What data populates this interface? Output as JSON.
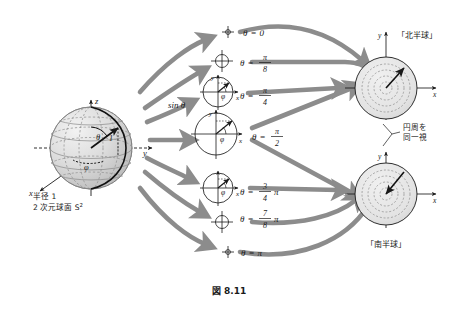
{
  "figure": {
    "caption": "図 8.11",
    "sphere": {
      "label_radius": "半径 1",
      "label_surface": "2 次元球面 S",
      "label_surface_sup": "2",
      "axis_x": "x",
      "axis_y": "y",
      "axis_z": "z",
      "angle_theta": "θ",
      "angle_phi": "φ",
      "radius_value": "1"
    },
    "sin_label": "sin θ",
    "slices": [
      {
        "id": "theta-0",
        "label_theta": "θ",
        "label_eq": "=",
        "label_value": "0",
        "kind": "point",
        "num": "",
        "den": "",
        "pi": ""
      },
      {
        "id": "theta-pi8",
        "label_theta": "θ",
        "label_eq": "=",
        "label_value": "",
        "kind": "circle-small",
        "num": "π",
        "den": "8",
        "pi": ""
      },
      {
        "id": "theta-pi4",
        "label_theta": "θ",
        "label_eq": "=",
        "label_value": "",
        "kind": "circle-mid",
        "num": "π",
        "den": "4",
        "pi": ""
      },
      {
        "id": "theta-pi2",
        "label_theta": "θ",
        "label_eq": "=",
        "label_value": "",
        "kind": "circle-large",
        "num": "π",
        "den": "2",
        "pi": ""
      },
      {
        "id": "theta-3pi4",
        "label_theta": "θ",
        "label_eq": "=",
        "label_value": "",
        "kind": "circle-mid",
        "num": "3",
        "den": "4",
        "pi": "π"
      },
      {
        "id": "theta-7pi8",
        "label_theta": "θ",
        "label_eq": "=",
        "label_value": "",
        "kind": "circle-small",
        "num": "7",
        "den": "8",
        "pi": "π"
      },
      {
        "id": "theta-pi",
        "label_theta": "θ",
        "label_eq": "=",
        "label_value": "π",
        "kind": "point",
        "num": "",
        "den": "",
        "pi": ""
      }
    ],
    "disks": [
      {
        "id": "north",
        "title": "「北半球」",
        "axis_x": "x",
        "axis_y": "y"
      },
      {
        "id": "south",
        "title": "「南半球」",
        "axis_x": "x",
        "axis_y": "y"
      }
    ],
    "annotation": {
      "line1": "円周を",
      "line2": "同一視"
    },
    "colors": {
      "background": "#ffffff",
      "ink": "#1a1a1a",
      "arrow_gray": "#8c8c8c",
      "sphere_fill": "#d9d9d9",
      "grid_gray": "#9a9a9a",
      "disk_fill": "#e2e2e2"
    }
  }
}
